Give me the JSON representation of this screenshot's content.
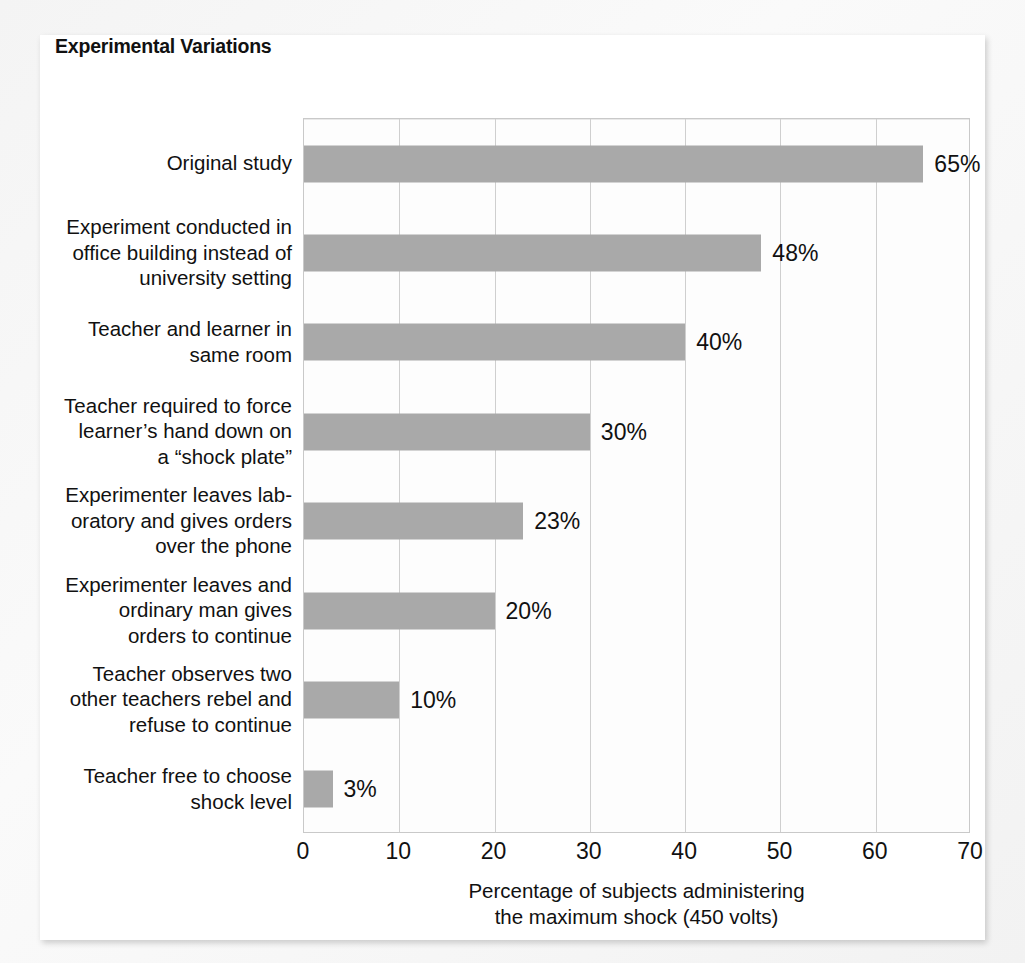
{
  "chart_title": "Experimental Variations",
  "chart_data": {
    "type": "bar",
    "orientation": "horizontal",
    "title": "Experimental Variations",
    "xlabel": "Percentage of subjects administering the maximum shock (450 volts)",
    "xlabel_lines": [
      "Percentage of subjects administering",
      "the maximum shock (450 volts)"
    ],
    "ylabel": "",
    "xlim": [
      0,
      70
    ],
    "xticks": [
      0,
      10,
      20,
      30,
      40,
      50,
      60,
      70
    ],
    "xtick_labels": [
      "0",
      "10",
      "20",
      "30",
      "40",
      "50",
      "60",
      "70"
    ],
    "grid": "vertical",
    "legend": "none",
    "bar_color": "#a9a9a9",
    "categories": [
      "Original study",
      "Experiment conducted in office building instead of university setting",
      "Teacher and learner in same room",
      "Teacher required to force learner’s hand down on a “shock plate”",
      "Experimenter leaves laboratory and gives orders over the phone",
      "Experimenter leaves and ordinary man gives orders to continue",
      "Teacher observes two other teachers rebel and refuse to continue",
      "Teacher free to choose shock level"
    ],
    "category_lines": [
      [
        "Original study"
      ],
      [
        "Experiment conducted in",
        "office building instead of",
        "university setting"
      ],
      [
        "Teacher and learner in",
        "same room"
      ],
      [
        "Teacher required to force",
        "learner’s hand down on",
        "a “shock plate”"
      ],
      [
        "Experimenter leaves lab-",
        "oratory and gives orders",
        "over the phone"
      ],
      [
        "Experimenter leaves and",
        "ordinary man gives",
        "orders to continue"
      ],
      [
        "Teacher observes two",
        "other teachers rebel and",
        "refuse to continue"
      ],
      [
        "Teacher free to choose",
        "shock level"
      ]
    ],
    "values": [
      65,
      48,
      40,
      30,
      23,
      20,
      10,
      3
    ],
    "value_labels": [
      "65%",
      "48%",
      "40%",
      "30%",
      "23%",
      "20%",
      "10%",
      "3%"
    ]
  }
}
